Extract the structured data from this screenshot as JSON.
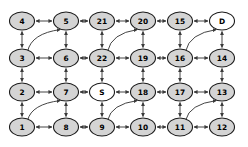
{
  "diagram": {
    "type": "directed-grid-graph",
    "rows": 4,
    "cols": 6,
    "background_color": "#ffffff",
    "node_fill_default": "#d4d4d4",
    "node_fill_terminal": "#ffffff",
    "node_stroke": "#1a1a1a",
    "edge_color": "#3a3a3a",
    "node_rx": 12.5,
    "node_ry": 9.0,
    "nodes": [
      {
        "id": "n4",
        "label": "4",
        "x": 22,
        "y": 21,
        "fill": "gray",
        "row": 0,
        "col": 0
      },
      {
        "id": "n5",
        "label": "5",
        "x": 66,
        "y": 21,
        "fill": "gray",
        "row": 0,
        "col": 1
      },
      {
        "id": "n21",
        "label": "21",
        "x": 102,
        "y": 21,
        "fill": "gray",
        "row": 0,
        "col": 2
      },
      {
        "id": "n20",
        "label": "20",
        "x": 143,
        "y": 21,
        "fill": "gray",
        "row": 0,
        "col": 3
      },
      {
        "id": "n15",
        "label": "15",
        "x": 180,
        "y": 21,
        "fill": "gray",
        "row": 0,
        "col": 4
      },
      {
        "id": "nD",
        "label": "D",
        "x": 222,
        "y": 21,
        "fill": "white",
        "row": 0,
        "col": 5
      },
      {
        "id": "n3",
        "label": "3",
        "x": 22,
        "y": 58,
        "fill": "gray",
        "row": 1,
        "col": 0
      },
      {
        "id": "n6",
        "label": "6",
        "x": 66,
        "y": 58,
        "fill": "gray",
        "row": 1,
        "col": 1
      },
      {
        "id": "n22",
        "label": "22",
        "x": 102,
        "y": 58,
        "fill": "gray",
        "row": 1,
        "col": 2
      },
      {
        "id": "n19",
        "label": "19",
        "x": 143,
        "y": 58,
        "fill": "gray",
        "row": 1,
        "col": 3
      },
      {
        "id": "n16",
        "label": "16",
        "x": 180,
        "y": 58,
        "fill": "gray",
        "row": 1,
        "col": 4
      },
      {
        "id": "n14",
        "label": "14",
        "x": 222,
        "y": 58,
        "fill": "gray",
        "row": 1,
        "col": 5
      },
      {
        "id": "n2",
        "label": "2",
        "x": 22,
        "y": 92,
        "fill": "gray",
        "row": 2,
        "col": 0
      },
      {
        "id": "n7",
        "label": "7",
        "x": 66,
        "y": 92,
        "fill": "gray",
        "row": 2,
        "col": 1
      },
      {
        "id": "nS",
        "label": "S",
        "x": 102,
        "y": 92,
        "fill": "white",
        "row": 2,
        "col": 2
      },
      {
        "id": "n18",
        "label": "18",
        "x": 143,
        "y": 92,
        "fill": "gray",
        "row": 2,
        "col": 3
      },
      {
        "id": "n17",
        "label": "17",
        "x": 180,
        "y": 92,
        "fill": "gray",
        "row": 2,
        "col": 4
      },
      {
        "id": "n13",
        "label": "13",
        "x": 222,
        "y": 92,
        "fill": "gray",
        "row": 2,
        "col": 5
      },
      {
        "id": "n1",
        "label": "1",
        "x": 22,
        "y": 127,
        "fill": "gray",
        "row": 3,
        "col": 0
      },
      {
        "id": "n8",
        "label": "8",
        "x": 66,
        "y": 127,
        "fill": "gray",
        "row": 3,
        "col": 1
      },
      {
        "id": "n9",
        "label": "9",
        "x": 102,
        "y": 127,
        "fill": "gray",
        "row": 3,
        "col": 2
      },
      {
        "id": "n10",
        "label": "10",
        "x": 143,
        "y": 127,
        "fill": "gray",
        "row": 3,
        "col": 3
      },
      {
        "id": "n11",
        "label": "11",
        "x": 180,
        "y": 127,
        "fill": "gray",
        "row": 3,
        "col": 4
      },
      {
        "id": "n12",
        "label": "12",
        "x": 222,
        "y": 127,
        "fill": "gray",
        "row": 3,
        "col": 5
      }
    ],
    "horizontal_edges": [
      [
        "n4",
        "n5"
      ],
      [
        "n5",
        "n21"
      ],
      [
        "n21",
        "n20"
      ],
      [
        "n20",
        "n15"
      ],
      [
        "n15",
        "nD"
      ],
      [
        "n3",
        "n6"
      ],
      [
        "n6",
        "n22"
      ],
      [
        "n22",
        "n19"
      ],
      [
        "n19",
        "n16"
      ],
      [
        "n16",
        "n14"
      ],
      [
        "n2",
        "n7"
      ],
      [
        "n7",
        "nS"
      ],
      [
        "nS",
        "n18"
      ],
      [
        "n18",
        "n17"
      ],
      [
        "n17",
        "n13"
      ],
      [
        "n1",
        "n8"
      ],
      [
        "n8",
        "n9"
      ],
      [
        "n9",
        "n10"
      ],
      [
        "n10",
        "n11"
      ],
      [
        "n11",
        "n12"
      ]
    ],
    "vertical_edges": [
      [
        "n4",
        "n3"
      ],
      [
        "n3",
        "n2"
      ],
      [
        "n2",
        "n1"
      ],
      [
        "n5",
        "n6"
      ],
      [
        "n6",
        "n7"
      ],
      [
        "n7",
        "n8"
      ],
      [
        "n21",
        "n22"
      ],
      [
        "n22",
        "nS"
      ],
      [
        "nS",
        "n9"
      ],
      [
        "n20",
        "n19"
      ],
      [
        "n19",
        "n18"
      ],
      [
        "n18",
        "n10"
      ],
      [
        "n15",
        "n16"
      ],
      [
        "n16",
        "n17"
      ],
      [
        "n17",
        "n11"
      ],
      [
        "nD",
        "n14"
      ],
      [
        "n14",
        "n13"
      ],
      [
        "n13",
        "n12"
      ]
    ],
    "curved_edges": [
      {
        "from": "n3",
        "to": "n5",
        "label": ""
      },
      {
        "from": "n22",
        "to": "n20",
        "label": ""
      },
      {
        "from": "n16",
        "to": "nD",
        "label": ""
      },
      {
        "from": "n1",
        "to": "n7",
        "label": ""
      },
      {
        "from": "n9",
        "to": "n18",
        "label": ""
      },
      {
        "from": "n11",
        "to": "n13",
        "label": ""
      }
    ]
  }
}
